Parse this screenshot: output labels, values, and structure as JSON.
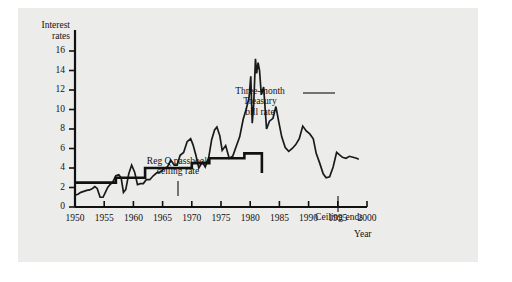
{
  "figure": {
    "background_color": "#ececeb",
    "ink_color": "#111111",
    "axis_titles": {
      "y_line1": "Interest",
      "y_line2": "rates",
      "x": "Year"
    }
  },
  "chart_data": {
    "type": "line",
    "title": "",
    "subtitle": "",
    "xlabel": "Year",
    "ylabel": "Interest rates",
    "xlim": [
      1950,
      2000
    ],
    "ylim": [
      0,
      17
    ],
    "grid": false,
    "legend_position": "none",
    "x_ticks": [
      "1950",
      "1955",
      "1960",
      "1965",
      "1970",
      "1975",
      "1980",
      "1985",
      "1990",
      "1995",
      "2000"
    ],
    "x_tick_values": [
      1950,
      1955,
      1960,
      1965,
      1970,
      1975,
      1980,
      1985,
      1990,
      1995,
      2000
    ],
    "y_ticks": [
      "0",
      "2",
      "4",
      "6",
      "8",
      "10",
      "12",
      "14",
      "16"
    ],
    "y_tick_values": [
      0,
      2,
      4,
      6,
      8,
      10,
      12,
      14,
      16
    ],
    "annotations": [
      {
        "name": "treasury-bill-label",
        "lines": [
          "Three-month",
          "Treasury",
          "bill rate"
        ],
        "text": "Three-month Treasury bill rate",
        "leader": "horizontal-right"
      },
      {
        "name": "reg-q-label",
        "lines": [
          "Reg Q passbook",
          "ceiling rate"
        ],
        "text": "Reg Q passbook ceiling rate",
        "leader": "vertical-down"
      },
      {
        "name": "ceiling-ends-label",
        "lines": [
          "Ceiling ends"
        ],
        "text": "Ceiling ends",
        "leader": "vertical-up"
      }
    ],
    "series": [
      {
        "name": "Three-month Treasury bill rate",
        "style": "thin-line",
        "x": [
          1950.0,
          1950.5,
          1951.0,
          1951.5,
          1952.0,
          1952.5,
          1953.0,
          1953.4,
          1953.8,
          1954.3,
          1954.8,
          1955.2,
          1955.6,
          1956.0,
          1956.5,
          1957.0,
          1957.5,
          1957.9,
          1958.3,
          1958.7,
          1959.2,
          1959.7,
          1960.2,
          1960.7,
          1961.2,
          1961.7,
          1962.2,
          1962.8,
          1963.4,
          1964.0,
          1964.6,
          1965.2,
          1965.8,
          1966.4,
          1967.0,
          1967.5,
          1968.0,
          1968.6,
          1969.2,
          1969.8,
          1970.2,
          1970.7,
          1971.2,
          1971.8,
          1972.3,
          1972.9,
          1973.4,
          1973.9,
          1974.3,
          1974.8,
          1975.2,
          1975.8,
          1976.4,
          1977.0,
          1977.6,
          1978.2,
          1978.8,
          1979.3,
          1979.8,
          1980.1,
          1980.35,
          1980.6,
          1980.9,
          1981.1,
          1981.35,
          1981.6,
          1981.9,
          1982.3,
          1982.8,
          1983.3,
          1983.9,
          1984.4,
          1984.9,
          1985.4,
          1986.0,
          1986.6,
          1987.2,
          1987.8,
          1988.4,
          1989.0,
          1989.6,
          1990.2,
          1990.8,
          1991.3,
          1991.9,
          1992.5,
          1993.0,
          1993.6,
          1994.2,
          1994.8,
          1995.2,
          1995.8,
          1996.4,
          1997.0,
          1997.6,
          1998.2,
          1998.6
        ],
        "y": [
          1.2,
          1.3,
          1.5,
          1.6,
          1.7,
          1.75,
          1.9,
          2.1,
          1.9,
          1.0,
          1.0,
          1.5,
          2.0,
          2.3,
          2.6,
          3.2,
          3.3,
          3.0,
          1.5,
          1.8,
          3.4,
          4.3,
          3.6,
          2.3,
          2.4,
          2.4,
          2.8,
          2.8,
          3.2,
          3.5,
          3.6,
          3.9,
          4.1,
          4.8,
          4.3,
          4.3,
          5.3,
          5.6,
          6.7,
          7.0,
          6.4,
          5.3,
          4.0,
          4.6,
          4.1,
          5.1,
          6.9,
          7.9,
          8.2,
          7.3,
          5.8,
          6.3,
          5.0,
          5.2,
          6.2,
          7.2,
          9.0,
          10.0,
          11.2,
          13.4,
          8.6,
          10.5,
          15.2,
          13.7,
          14.8,
          14.0,
          11.5,
          12.3,
          8.0,
          8.8,
          9.1,
          10.3,
          8.7,
          7.2,
          6.1,
          5.7,
          6.0,
          6.4,
          7.0,
          8.3,
          7.8,
          7.5,
          7.0,
          5.5,
          4.5,
          3.4,
          3.0,
          3.1,
          4.1,
          5.6,
          5.4,
          5.1,
          5.0,
          5.2,
          5.1,
          5.0,
          4.9
        ]
      },
      {
        "name": "Reg Q passbook ceiling rate",
        "style": "thick-step",
        "x": [
          1950.0,
          1957.0,
          1957.0,
          1962.0,
          1962.0,
          1966.0,
          1966.0,
          1970.0,
          1970.0,
          1973.0,
          1973.0,
          1979.0,
          1979.0,
          1982.0,
          1982.0
        ],
        "y": [
          2.5,
          2.5,
          3.0,
          3.0,
          4.0,
          4.0,
          4.0,
          4.0,
          4.5,
          4.5,
          5.0,
          5.0,
          5.5,
          5.5,
          3.5
        ]
      }
    ]
  }
}
